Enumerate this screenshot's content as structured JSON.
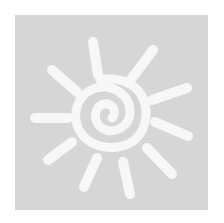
{
  "icon": {
    "name": "sun-icon",
    "description": "Hand-drawn white sun with spiral center on a gray square",
    "colors": {
      "background": "#ffffff",
      "tile": "#d6d6d6",
      "glyph": "#f7f7f7"
    },
    "ray_count": 10
  }
}
